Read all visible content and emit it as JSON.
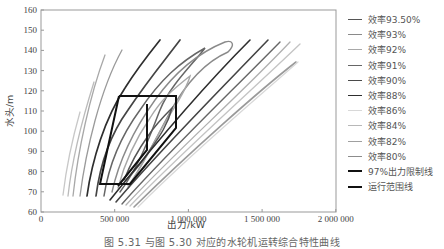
{
  "chart_data": {
    "type": "line",
    "title": "",
    "xlabel": "出力/kW",
    "ylabel": "水头/m",
    "xlim": [
      0,
      2000000
    ],
    "ylim": [
      60,
      160
    ],
    "y_axis_bottom_label": "0",
    "x_ticks": [
      "0",
      "500 000",
      "1 000 000",
      "1 500 000",
      "2 000 000"
    ],
    "y_ticks": [
      "160",
      "150",
      "140",
      "130",
      "120",
      "110",
      "100",
      "90",
      "80",
      "70",
      "60"
    ],
    "grid": false,
    "legend_position": "right",
    "series": [
      {
        "name": "效率93.50%",
        "color": "#555555",
        "width": 1.6
      },
      {
        "name": "效率93%",
        "color": "#8a8a8a",
        "width": 1.4
      },
      {
        "name": "效率92%",
        "color": "#a8a8a8",
        "width": 1.4
      },
      {
        "name": "效率91%",
        "color": "#666666",
        "width": 1.6
      },
      {
        "name": "效率90%",
        "color": "#4a4a4a",
        "width": 1.8
      },
      {
        "name": "效率88%",
        "color": "#2e2e2e",
        "width": 1.8
      },
      {
        "name": "效率86%",
        "color": "#d8d8d8",
        "width": 1.4
      },
      {
        "name": "效率84%",
        "color": "#b8b8b8",
        "width": 1.4
      },
      {
        "name": "效率82%",
        "color": "#a0a0a0",
        "width": 1.4
      },
      {
        "name": "效率80%",
        "color": "#8c8c8c",
        "width": 1.4
      },
      {
        "name": "97%出力限制线",
        "color": "#111111",
        "width": 2.2
      },
      {
        "name": "运行范围线",
        "color": "#111111",
        "width": 2.2
      }
    ],
    "operating_range_polygon": [
      [
        530000,
        117
      ],
      [
        920000,
        117
      ],
      [
        920000,
        101
      ],
      [
        720000,
        74
      ],
      [
        400000,
        74
      ],
      [
        530000,
        117
      ]
    ],
    "limit_line_97pct": [
      [
        720000,
        113
      ],
      [
        720000,
        90
      ],
      [
        620000,
        74
      ]
    ]
  },
  "caption": "图 5.31   与图 5.30 对应的水轮机运转综合特性曲线"
}
